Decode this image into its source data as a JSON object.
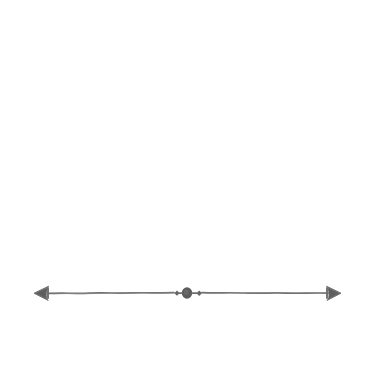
{
  "canvas": {
    "width": 374,
    "height": 370,
    "background_color": "#ffffff",
    "title": "Hand-drawn horizontal divider ornament"
  },
  "artwork": {
    "name": "double-headed-arrow-divider",
    "description": "A hand-drawn, slightly wavy horizontal rule with barbed arrowheads at both ends and a small oval bead flanked by two diamond dots at the center",
    "ink_color": "#6e6e6e",
    "ink_color_dark": "#5c5c5c",
    "stroke_width": 1.6,
    "baseline_y": 293,
    "left_tip_x": 34,
    "right_tip_x": 341,
    "center_x": 187
  },
  "elements": {
    "left_arrowhead": {
      "label": "left-arrowhead",
      "tip_x": 34,
      "base_x": 48,
      "half_height": 7
    },
    "left_crossbar": {
      "label": "left-crossbar",
      "x": 48,
      "half_height": 5
    },
    "right_arrowhead": {
      "label": "right-arrowhead",
      "tip_x": 341,
      "base_x": 327,
      "half_height": 7
    },
    "right_crossbar": {
      "label": "right-crossbar",
      "x": 327,
      "half_height": 5
    },
    "center_bead": {
      "label": "center-oval-bead",
      "cx": 187,
      "cy": 293,
      "rx": 5.2,
      "ry": 5.8
    },
    "left_dot": {
      "label": "left-diamond-dot",
      "cx": 177,
      "cy": 293,
      "r": 2.4
    },
    "right_dot": {
      "label": "right-diamond-dot",
      "cx": 199,
      "cy": 293,
      "r": 2.6
    },
    "left_rule": {
      "label": "left-rule-segment",
      "from_x": 48,
      "to_x": 174
    },
    "right_rule": {
      "label": "right-rule-segment",
      "from_x": 202,
      "to_x": 328
    }
  }
}
